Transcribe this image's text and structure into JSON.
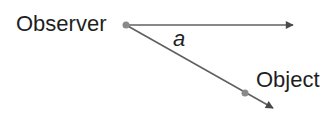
{
  "diagram": {
    "observer_label": "Observer",
    "object_label": "Object",
    "angle_label": "a",
    "colors": {
      "line": "#606060",
      "arrow": "#4a4a4a",
      "point": "#8a8a8a",
      "text": "#1f1f1f"
    }
  }
}
